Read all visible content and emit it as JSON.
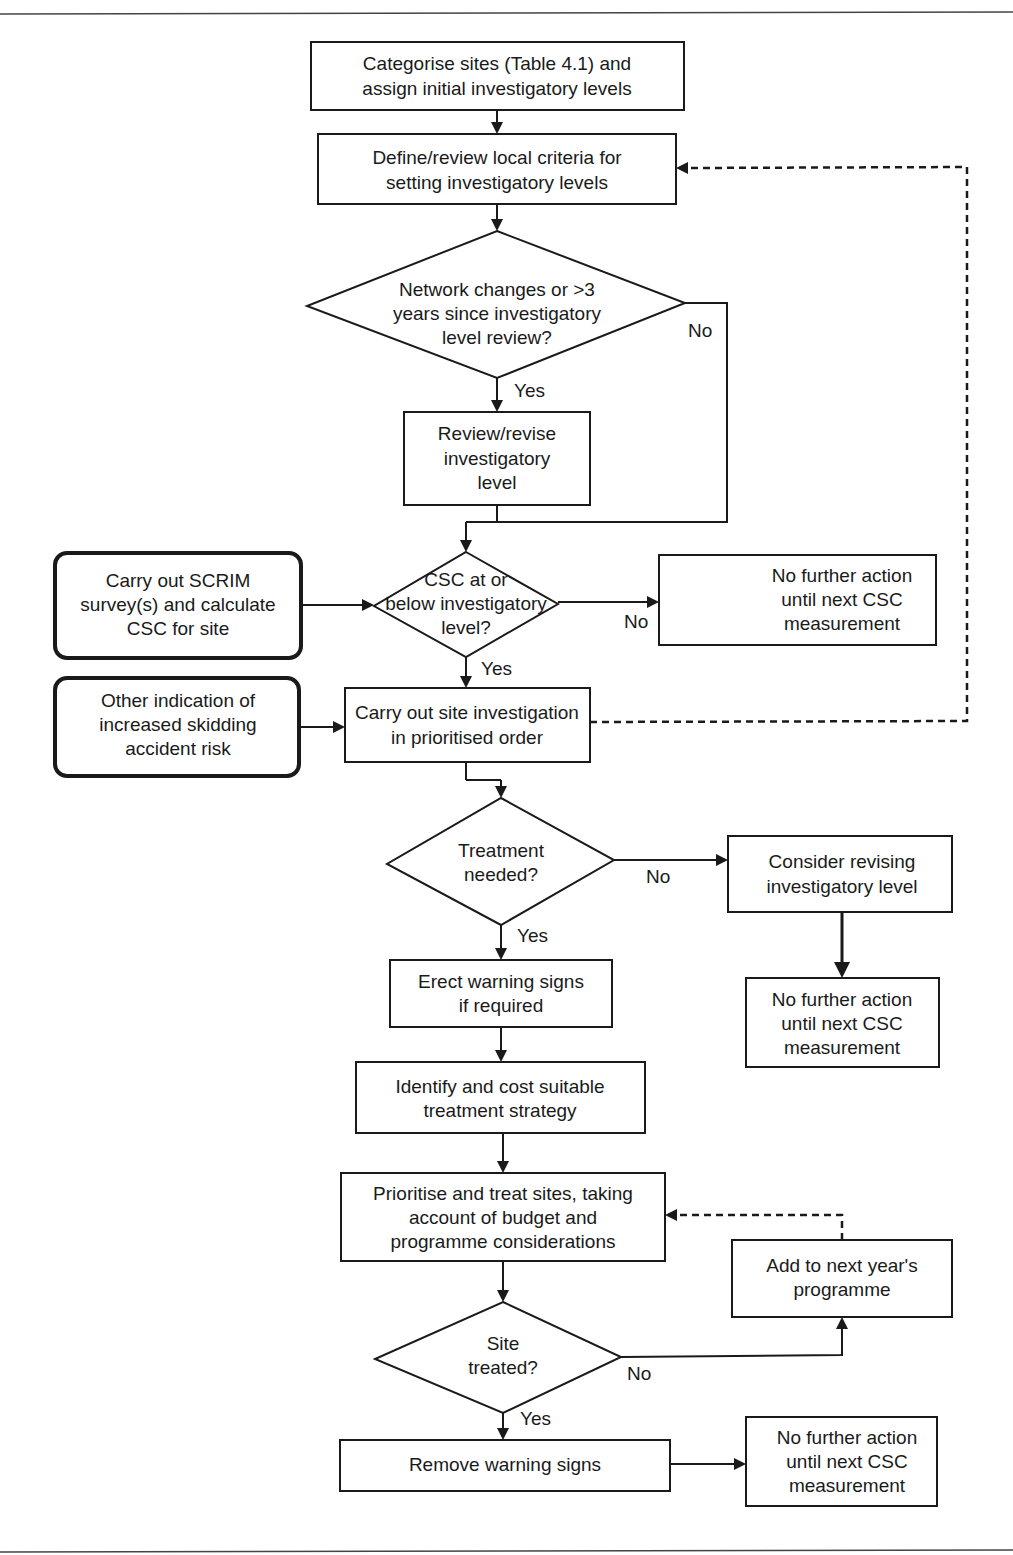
{
  "nodes": {
    "categorise": {
      "lines": [
        "Categorise sites (Table 4.1) and",
        "assign initial investigatory levels"
      ]
    },
    "define": {
      "lines": [
        "Define/review local criteria for",
        "setting investigatory levels"
      ]
    },
    "network_decision": {
      "lines": [
        "Network changes or >3",
        "years since investigatory",
        "level review?"
      ]
    },
    "review_revise": {
      "lines": [
        "Review/revise",
        "investigatory",
        "level"
      ]
    },
    "scrim": {
      "lines": [
        "Carry out SCRIM",
        "survey(s) and calculate",
        "CSC for site"
      ]
    },
    "csc_decision": {
      "lines": [
        "CSC at or",
        "below investigatory",
        "level?"
      ]
    },
    "no_action_1": {
      "lines": [
        "No further action",
        "until next CSC",
        "measurement"
      ]
    },
    "other_indication": {
      "lines": [
        "Other indication of",
        "increased skidding",
        "accident risk"
      ]
    },
    "site_investigation": {
      "lines": [
        "Carry out site investigation",
        "in prioritised order"
      ]
    },
    "treatment_decision": {
      "lines": [
        "Treatment",
        "needed?"
      ]
    },
    "consider_revising": {
      "lines": [
        "Consider revising",
        "investigatory level"
      ]
    },
    "no_action_2": {
      "lines": [
        "No further action",
        "until next CSC",
        "measurement"
      ]
    },
    "erect_signs": {
      "lines": [
        "Erect warning signs",
        "if required"
      ]
    },
    "identify_cost": {
      "lines": [
        "Identify and cost suitable",
        "treatment strategy"
      ]
    },
    "prioritise_treat": {
      "lines": [
        "Prioritise and treat sites, taking",
        "account of budget and",
        "programme considerations"
      ]
    },
    "add_next_year": {
      "lines": [
        "Add to next year's",
        "programme"
      ]
    },
    "site_treated_decision": {
      "lines": [
        "Site",
        "treated?"
      ]
    },
    "remove_signs": {
      "lines": [
        "Remove warning signs"
      ]
    },
    "no_action_3": {
      "lines": [
        "No further action",
        "until next CSC",
        "measurement"
      ]
    }
  },
  "edge_labels": {
    "network_no": "No",
    "network_yes": "Yes",
    "csc_no": "No",
    "csc_yes": "Yes",
    "treatment_no": "No",
    "treatment_yes": "Yes",
    "treated_no": "No",
    "treated_yes": "Yes"
  }
}
